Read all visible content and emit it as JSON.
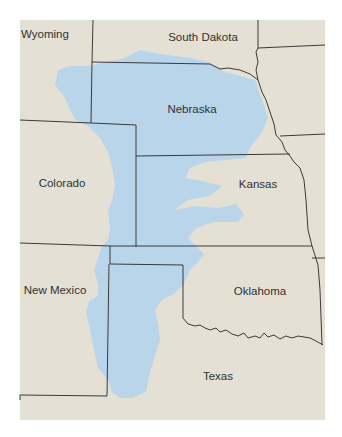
{
  "map": {
    "colors": {
      "land": "#e4e1d4",
      "aquifer": "#b9d5ea",
      "border": "#3a3a3a",
      "background": "#ffffff"
    },
    "states": [
      {
        "name": "Wyoming",
        "x": 45,
        "y": 34
      },
      {
        "name": "South Dakota",
        "x": 203,
        "y": 37
      },
      {
        "name": "Nebraska",
        "x": 192,
        "y": 109
      },
      {
        "name": "Colorado",
        "x": 62,
        "y": 183
      },
      {
        "name": "Kansas",
        "x": 258,
        "y": 184
      },
      {
        "name": "New Mexico",
        "x": 55,
        "y": 290
      },
      {
        "name": "Oklahoma",
        "x": 260,
        "y": 291
      },
      {
        "name": "Texas",
        "x": 218,
        "y": 376
      }
    ]
  }
}
